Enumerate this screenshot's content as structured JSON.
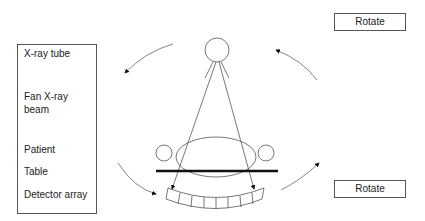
{
  "labels": {
    "xray_tube": "X-ray tube",
    "fan_beam_line1": "Fan X-ray",
    "fan_beam_line2": "beam",
    "patient": "Patient",
    "table": "Table",
    "detector": "Detector array"
  },
  "rotate_labels": {
    "top": "Rotate",
    "bottom": "Rotate"
  },
  "diagram": {
    "detector_segments": 8,
    "stroke_color": "#555555",
    "table_color": "#111111"
  }
}
